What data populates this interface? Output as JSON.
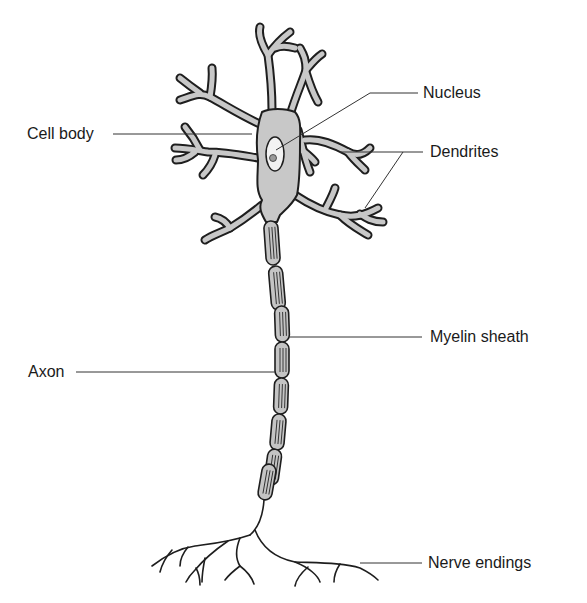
{
  "diagram": {
    "colors": {
      "background": "#ffffff",
      "cell_fill": "#c8c8c8",
      "outline": "#1e1e1e",
      "leader_line": "#333333",
      "text": "#1a1a1a"
    },
    "labels": {
      "nucleus": "Nucleus",
      "cell_body": "Cell body",
      "dendrites": "Dendrites",
      "myelin_sheath": "Myelin sheath",
      "axon": "Axon",
      "nerve_endings": "Nerve endings"
    },
    "myelin_segment_count": 8
  }
}
